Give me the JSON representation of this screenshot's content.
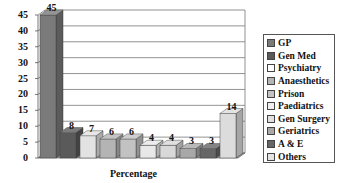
{
  "chart_data": {
    "type": "bar",
    "title": "",
    "xlabel": "Percentage",
    "ylabel": "",
    "ylim": [
      0,
      45
    ],
    "yticks": [
      0,
      5,
      10,
      15,
      20,
      25,
      30,
      35,
      40,
      45
    ],
    "grid": true,
    "style": "3d-column",
    "legend_position": "right",
    "categories": [
      "GP",
      "Gen Med",
      "Psychiatry",
      "Anaesthetics",
      "Prison",
      "Paediatrics",
      "Gen Surgery",
      "Geriatrics",
      "A & E",
      "Others"
    ],
    "values": [
      45,
      8,
      7,
      6,
      6,
      4,
      4,
      3,
      3,
      14
    ],
    "colors": [
      "#7a7a7a",
      "#5a5a5a",
      "#e2e2e2",
      "#b4b4b4",
      "#c2c2c2",
      "#e8e8e8",
      "#d8d8d8",
      "#a8a8a8",
      "#666666",
      "#dcdcdc"
    ]
  },
  "legend": {
    "items": [
      {
        "label": "GP",
        "color": "#7a7a7a"
      },
      {
        "label": "Gen Med",
        "color": "#5a5a5a"
      },
      {
        "label": "Psychiatry",
        "color": "#ffffff"
      },
      {
        "label": "Anaesthetics",
        "color": "#b4b4b4"
      },
      {
        "label": "Prison",
        "color": "#c2c2c2"
      },
      {
        "label": "Paediatrics",
        "color": "#f0f0f0"
      },
      {
        "label": "Gen Surgery",
        "color": "#e0e0e0"
      },
      {
        "label": "Geriatrics",
        "color": "#a8a8a8"
      },
      {
        "label": "A & E",
        "color": "#666666"
      },
      {
        "label": "Others",
        "color": "#e4e4e4"
      }
    ]
  }
}
